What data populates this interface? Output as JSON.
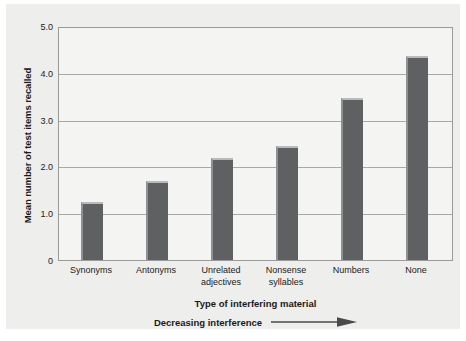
{
  "chart_data": {
    "type": "bar",
    "title": "",
    "categories": [
      "Synonyms",
      "Antonyms",
      "Unrelated adjectives",
      "Nonsense syllables",
      "Numbers",
      "None"
    ],
    "category_lines": [
      [
        "Synonyms"
      ],
      [
        "Antonyms"
      ],
      [
        "Unrelated",
        "adjectives"
      ],
      [
        "Nonsense",
        "syllables"
      ],
      [
        "Numbers"
      ],
      [
        "None"
      ]
    ],
    "values": [
      1.25,
      1.7,
      2.2,
      2.45,
      3.5,
      4.4
    ],
    "xlabel": "Type of interfering material",
    "ylabel": "Mean number of test items recalled",
    "ylim": [
      0,
      5.0
    ],
    "yticks": [
      "5.0",
      "4.0",
      "3.0",
      "2.0",
      "1.0",
      "0"
    ],
    "ytick_values": [
      5.0,
      4.0,
      3.0,
      2.0,
      1.0,
      0
    ],
    "grid": true,
    "gridlines_at": [
      5.0,
      4.0,
      3.0,
      2.0,
      1.0
    ],
    "legend": "none",
    "annotation": "Decreasing interference",
    "annotation_arrow": "right-arrow-icon",
    "bar_color": "#5f6061",
    "plot_background": "#f4f4f2",
    "page_background": "#eeeeec",
    "grid_color": "#a8a8a6"
  }
}
